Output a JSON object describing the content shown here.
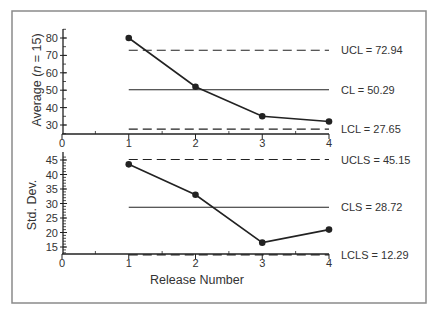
{
  "chart_data": [
    {
      "type": "line",
      "title": "",
      "xlabel": "",
      "ylabel": "Average (n = 15)",
      "ylabel_parts": {
        "before": "Average (",
        "italic": "n",
        "after": " = 15)"
      },
      "x": [
        1,
        2,
        3,
        4
      ],
      "xticks": [
        0,
        1,
        2,
        3,
        4
      ],
      "xlim": [
        0,
        4
      ],
      "yticks": [
        30,
        40,
        50,
        60,
        70,
        80
      ],
      "ylim": [
        24,
        85
      ],
      "grid": false,
      "series": [
        {
          "name": "Average",
          "values": [
            80,
            52,
            35,
            32
          ]
        }
      ],
      "control_lines": [
        {
          "name": "UCL",
          "value": 72.94,
          "style": "dashed",
          "label": "UCL = 72.94"
        },
        {
          "name": "CL",
          "value": 50.29,
          "style": "solid",
          "label": "CL = 50.29"
        },
        {
          "name": "LCL",
          "value": 27.65,
          "style": "dashed",
          "label": "LCL = 27.65"
        }
      ]
    },
    {
      "type": "line",
      "title": "",
      "xlabel": "Release Number",
      "ylabel": "Std. Dev.",
      "x": [
        1,
        2,
        3,
        4
      ],
      "xticks": [
        0,
        1,
        2,
        3,
        4
      ],
      "xlim": [
        0,
        4
      ],
      "yticks": [
        15,
        20,
        25,
        30,
        35,
        40,
        45
      ],
      "ylim": [
        12.5,
        46
      ],
      "grid": false,
      "series": [
        {
          "name": "Std. Dev.",
          "values": [
            43.5,
            33,
            16.5,
            21
          ]
        }
      ],
      "control_lines": [
        {
          "name": "UCLS",
          "value": 45.15,
          "style": "dashed",
          "label": "UCLS = 45.15"
        },
        {
          "name": "CLS",
          "value": 28.72,
          "style": "solid",
          "label": "CLS = 28.72"
        },
        {
          "name": "LCLS",
          "value": 12.29,
          "style": "dashed",
          "label": "LCLS = 12.29"
        }
      ]
    }
  ],
  "colors": {
    "line": "#222222",
    "frame": "#888888",
    "text": "#333333"
  }
}
